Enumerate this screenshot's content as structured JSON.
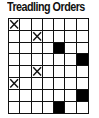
{
  "title": "Treadling Orders",
  "chart_data": {
    "type": "table",
    "title": "Treadling Orders",
    "columns": 7,
    "rows": 8,
    "legend": {
      "x": "X-marked cell",
      "filled": "solid black cell",
      "empty": "blank cell"
    },
    "cells": [
      [
        "x",
        "",
        "",
        "",
        "",
        "",
        ""
      ],
      [
        "",
        "",
        "x",
        "",
        "",
        "",
        ""
      ],
      [
        "",
        "",
        "",
        "",
        "filled",
        "",
        ""
      ],
      [
        "",
        "",
        "",
        "",
        "",
        "",
        "filled"
      ],
      [
        "",
        "",
        "x",
        "",
        "",
        "",
        ""
      ],
      [
        "x",
        "",
        "",
        "",
        "",
        "",
        ""
      ],
      [
        "",
        "",
        "",
        "",
        "",
        "",
        "filled"
      ],
      [
        "",
        "",
        "",
        "",
        "filled",
        "",
        ""
      ]
    ]
  },
  "colors": {
    "line": "#111111",
    "fill": "#000000",
    "background": "#ffffff"
  }
}
